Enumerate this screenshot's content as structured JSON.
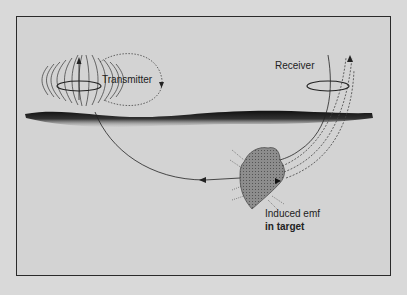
{
  "diagram": {
    "title": "",
    "labels": {
      "transmitter": "Transmitter",
      "receiver": "Receiver",
      "induced_line1": "Induced emf",
      "induced_line2": "in target"
    },
    "colors": {
      "background": "#d9d9d9",
      "panel": "#d3d3d3",
      "ink": "#222222",
      "ground": "#1e1e1e",
      "target": "#8a8a8a"
    },
    "elements": [
      "transmitter coil with dipole field lines",
      "receiver coil",
      "ground surface layer",
      "primary field path from transmitter to target",
      "secondary field paths from target to receiver",
      "buried conductive target with eddy currents"
    ]
  }
}
